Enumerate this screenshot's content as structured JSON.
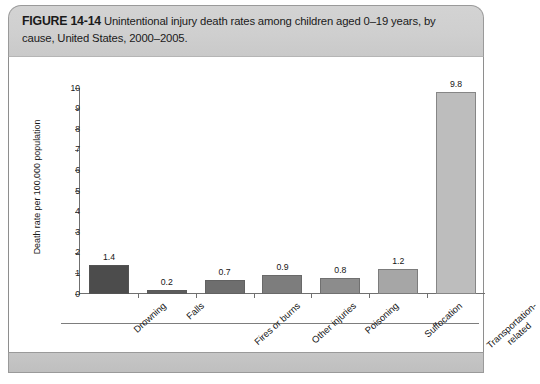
{
  "figure": {
    "number_label": "FIGURE 14-14",
    "caption": "Unintentional injury death rates among children aged 0–19 years, by cause, United States, 2000–2005."
  },
  "chart_data": {
    "type": "bar",
    "title": "",
    "xlabel": "",
    "ylabel": "Death rate per 100,000 population",
    "ylim": [
      0,
      10
    ],
    "ytick_labels": [
      "0",
      "1",
      "2",
      "3",
      "4",
      "5",
      "6",
      "7",
      "8",
      "9",
      "10"
    ],
    "grid": false,
    "legend": "none",
    "categories": [
      "Drowning",
      "Falls",
      "Fires or burns",
      "Other injuries",
      "Poisoning",
      "Suffocation",
      "Transportation-related"
    ],
    "category_lines": [
      [
        "Drowning"
      ],
      [
        "Falls"
      ],
      [
        "Fires or burns"
      ],
      [
        "Other injuries"
      ],
      [
        "Poisoning"
      ],
      [
        "Suffocation"
      ],
      [
        "Transportation-",
        "related"
      ]
    ],
    "values": [
      1.4,
      0.2,
      0.7,
      0.9,
      0.8,
      1.2,
      9.8
    ],
    "value_labels": [
      "1.4",
      "0.2",
      "0.7",
      "0.9",
      "0.8",
      "1.2",
      "9.8"
    ],
    "bar_colors": [
      "#4c4c4c",
      "#5c5c5c",
      "#6e6e6e",
      "#7d7d7d",
      "#8c8c8c",
      "#a6a6a6",
      "#bdbdbd"
    ]
  },
  "styling": {
    "caption_band_color": "#cfcfcf",
    "footer_band_color": "#c3c3c3",
    "axis_color": "#6f6f6f",
    "page_background": "#ffffff"
  }
}
